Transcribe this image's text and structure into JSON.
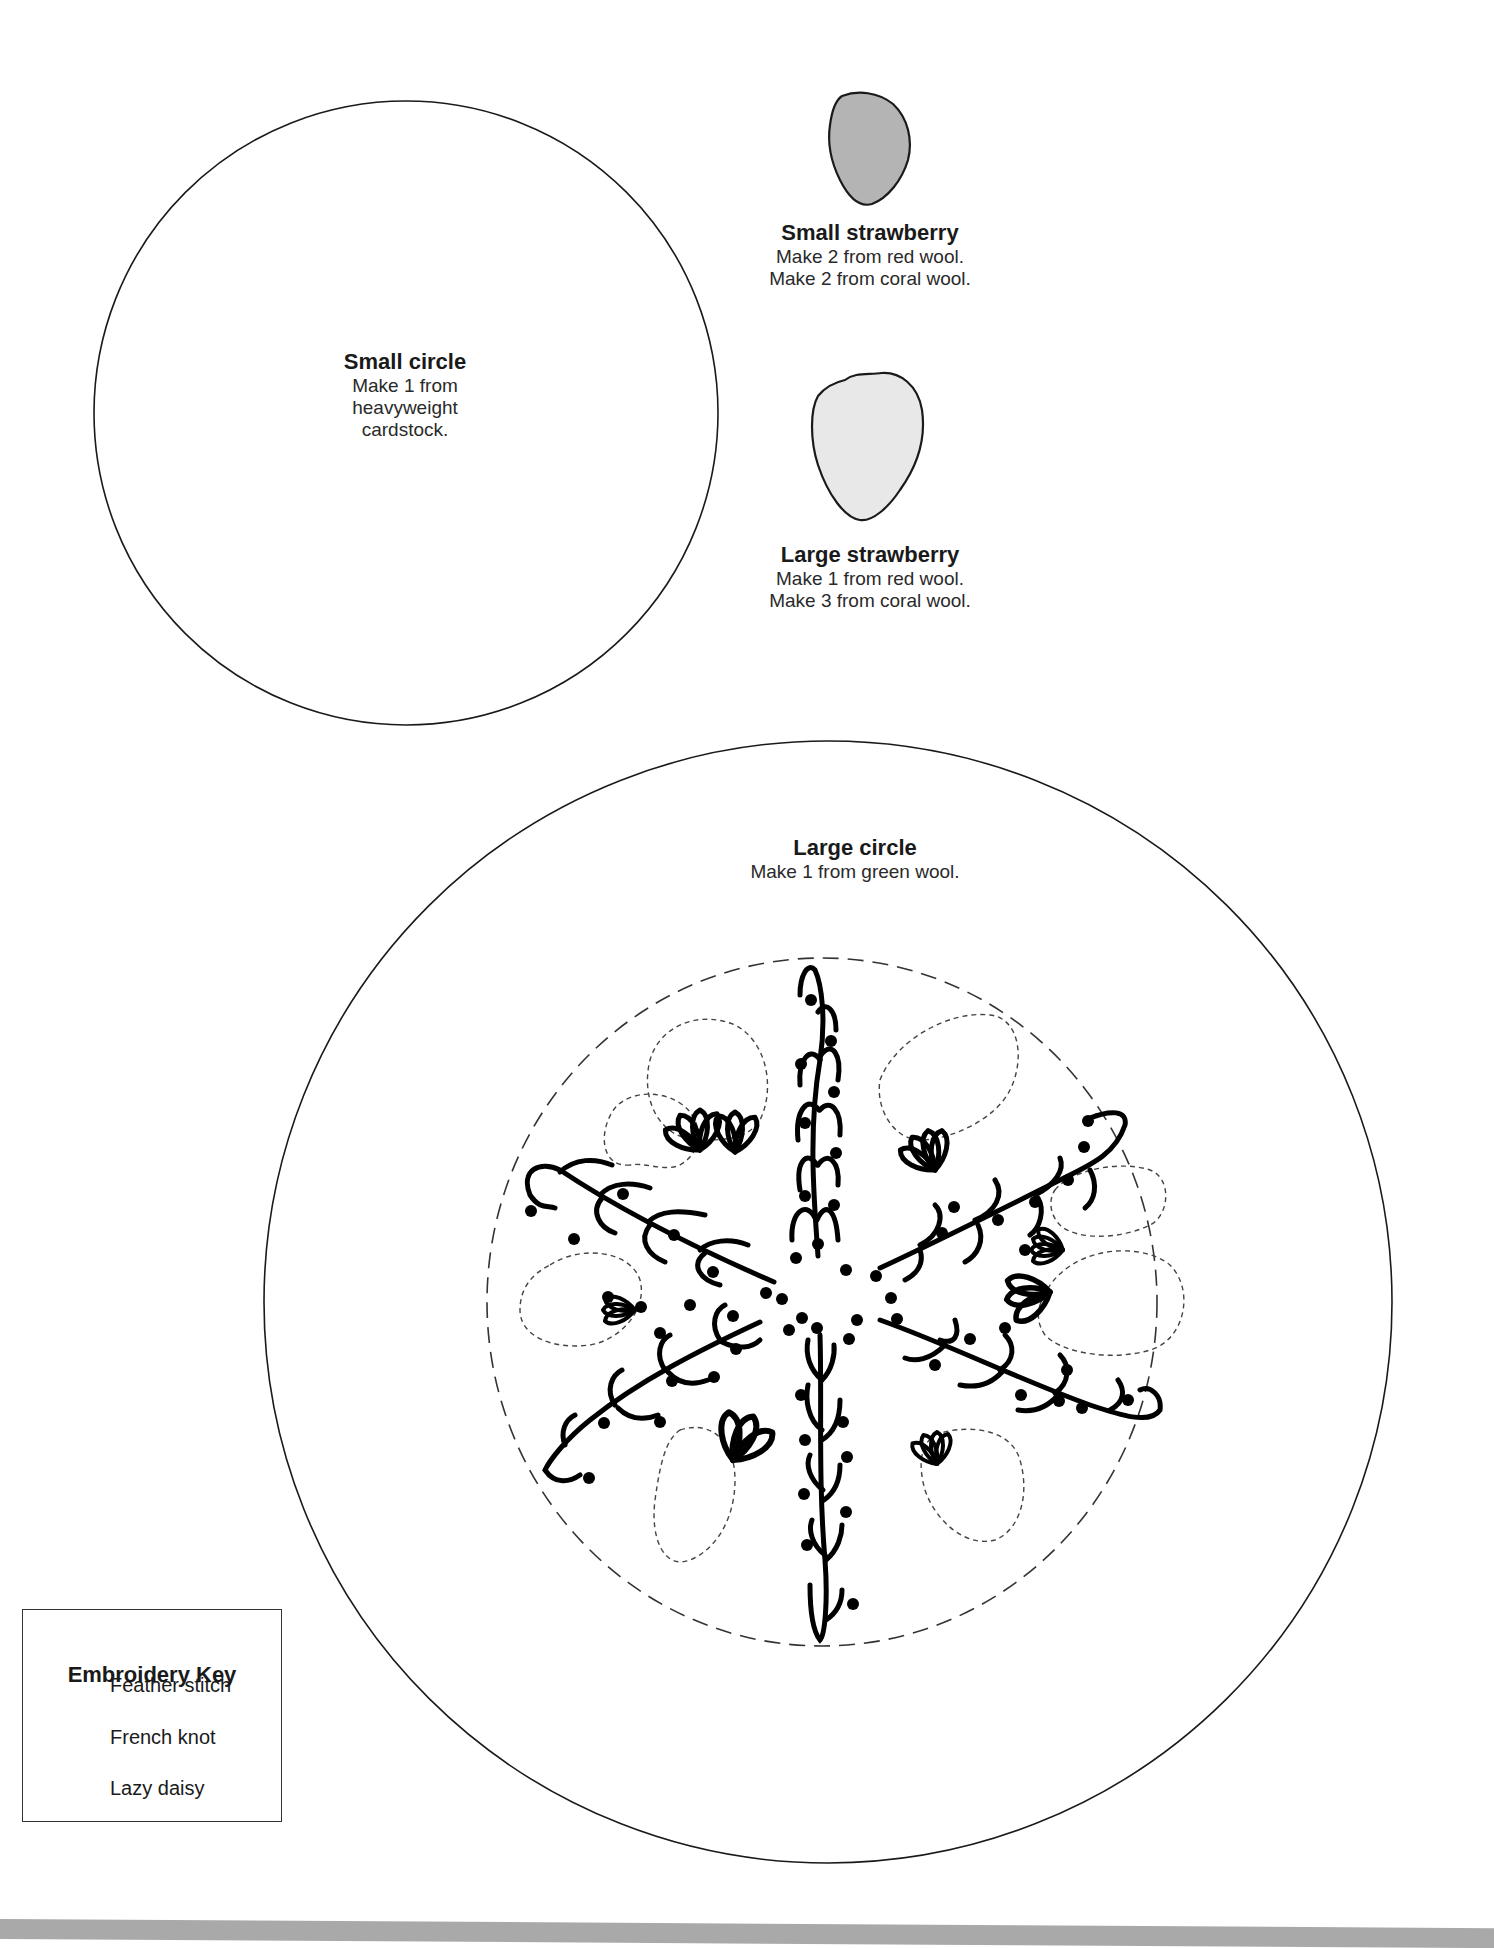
{
  "page": {
    "type": "sewing-embroidery-pattern-template"
  },
  "pieces": {
    "small_circle": {
      "title": "Small circle",
      "lines": [
        "Make 1 from",
        "heavyweight",
        "cardstock."
      ]
    },
    "small_strawberry": {
      "title": "Small strawberry",
      "lines": [
        "Make 2 from red wool.",
        "Make 2 from coral wool."
      ],
      "fill_color": "#b4b4b4"
    },
    "large_strawberry": {
      "title": "Large strawberry",
      "lines": [
        "Make 1 from red wool.",
        "Make 3 from coral wool."
      ],
      "fill_color": "#e8e8e8"
    },
    "large_circle": {
      "title": "Large circle",
      "lines": [
        "Make 1 from green wool."
      ]
    }
  },
  "embroidery_key": {
    "title": "Embroidery Key",
    "items": [
      {
        "icon": "feather-stitch-icon",
        "label": "Feather stitch"
      },
      {
        "icon": "french-knot-icon",
        "label": "French knot"
      },
      {
        "icon": "lazy-daisy-icon",
        "label": "Lazy daisy"
      }
    ]
  },
  "colors": {
    "outline": "#1a1a1a",
    "page_background": "#ffffff",
    "bottom_bar": "#a9a9a9"
  }
}
